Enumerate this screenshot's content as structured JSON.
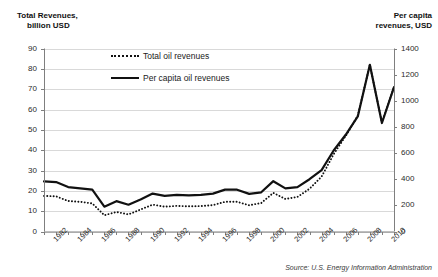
{
  "chart_data": {
    "type": "line",
    "title": "",
    "xlabel": "",
    "ylabel": "Total Revenues, billion USD",
    "y2label": "Per capita revenues, USD",
    "grid": true,
    "legend_position": "top-center",
    "ylim": [
      0,
      90
    ],
    "y2lim": [
      0,
      1400
    ],
    "yticks": [
      0,
      10,
      20,
      30,
      40,
      50,
      60,
      70,
      80,
      90
    ],
    "y2ticks": [
      0,
      200,
      400,
      600,
      800,
      1000,
      1200,
      1400
    ],
    "x": [
      1981,
      1982,
      1983,
      1984,
      1985,
      1986,
      1987,
      1988,
      1989,
      1990,
      1991,
      1992,
      1993,
      1994,
      1995,
      1996,
      1997,
      1998,
      1999,
      2000,
      2001,
      2002,
      2003,
      2004,
      2005,
      2006,
      2007,
      2008,
      2009,
      2010
    ],
    "xtick_labels": [
      "1982",
      "1984",
      "1986",
      "1988",
      "1990",
      "1992",
      "1994",
      "1996",
      "1998",
      "2000",
      "2002",
      "2004",
      "2006",
      "2008",
      "2010"
    ],
    "xtick_values": [
      1982,
      1984,
      1986,
      1988,
      1990,
      1992,
      1994,
      1996,
      1998,
      2000,
      2002,
      2004,
      2006,
      2008,
      2010
    ],
    "series": [
      {
        "name": "Total oil revenues",
        "style": "dotted",
        "axis": "left",
        "color": "#111111",
        "values": [
          17.5,
          17.3,
          15.0,
          14.6,
          13.8,
          8.0,
          9.6,
          8.4,
          10.8,
          13.2,
          12.2,
          12.6,
          12.4,
          12.5,
          13.0,
          14.6,
          14.6,
          12.9,
          14.0,
          19.0,
          16.0,
          17.0,
          21.0,
          27.0,
          38.0,
          47.0,
          57.0,
          82.0,
          53.5,
          71.0
        ]
      },
      {
        "name": "Per capita oil revenues",
        "style": "solid",
        "axis": "right",
        "color": "#111111",
        "values": [
          383,
          378,
          340,
          330,
          320,
          190,
          232,
          205,
          245,
          290,
          272,
          280,
          277,
          280,
          290,
          320,
          320,
          288,
          300,
          385,
          330,
          340,
          400,
          470,
          620,
          740,
          880,
          1275,
          830,
          1105
        ]
      }
    ],
    "source": "Source: U.S. Energy Information Administration"
  },
  "legend": {
    "items": [
      {
        "label": "Total oil revenues",
        "style": "dotted"
      },
      {
        "label": "Per capita oil revenues",
        "style": "solid"
      }
    ]
  },
  "axes": {
    "left_title_line1": "Total Revenues,",
    "left_title_line2": "billion USD",
    "right_title_line1": "Per capita",
    "right_title_line2": "revenues, USD"
  },
  "colors": {
    "line": "#111111",
    "grid": "#d9d9d9",
    "axis": "#7f7f7f",
    "text": "#1a1a1a",
    "background": "#ffffff"
  }
}
